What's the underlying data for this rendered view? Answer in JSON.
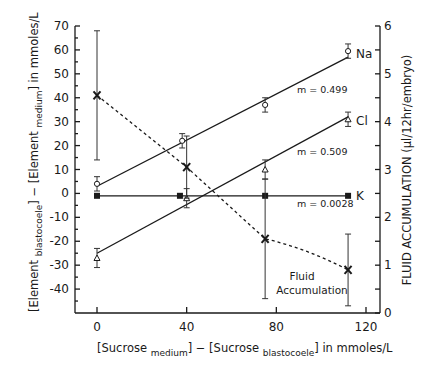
{
  "chart_data": {
    "type": "line",
    "title": "",
    "xlabel": "[Sucrose medium] − [Sucrose blastocoele] in mmoles/L",
    "xlabel_parts": {
      "bracket_open": "[",
      "a": "Sucrose",
      "a_sub": "medium",
      "minus": "] − [",
      "b": "Sucrose",
      "b_sub": "blastocoele",
      "unit": "] in mmoles/L"
    },
    "ylabel": "[Element blastocoele] − [Element medium] in mmoles/L",
    "ylabel_parts": {
      "a": "Element",
      "a_sub": "blastocoele",
      "minus": "] − [",
      "b": "Element",
      "b_sub": "medium",
      "unit": "] in mmoles/L"
    },
    "y2label": "FLUID ACCUMULATION (µl/12hr/embryo)",
    "xlim": [
      -10,
      122
    ],
    "ylim": [
      -50,
      70
    ],
    "y2lim": [
      0,
      6
    ],
    "x_ticks": [
      0,
      40,
      80,
      120
    ],
    "y_ticks": [
      70,
      60,
      50,
      40,
      30,
      20,
      10,
      0,
      -10,
      -20,
      -30,
      -40
    ],
    "y2_ticks": [
      6,
      5,
      4,
      3,
      2,
      1,
      0
    ],
    "grid": false,
    "series": [
      {
        "name": "Na",
        "marker": "open-circle",
        "line": "solid",
        "slope_label": "m = 0.499",
        "x": [
          0,
          38,
          75,
          112
        ],
        "values": [
          4,
          22,
          37,
          59.5
        ],
        "err": [
          3,
          3,
          3,
          3
        ],
        "fit": {
          "x0": 0,
          "y0": 3,
          "x1": 112,
          "y1": 57
        }
      },
      {
        "name": "Cl",
        "marker": "open-triangle",
        "line": "solid",
        "slope_label": "m = 0.509",
        "x": [
          0,
          40,
          75,
          112
        ],
        "values": [
          -27,
          -2,
          10,
          31
        ],
        "err": [
          4,
          4,
          4,
          3
        ],
        "fit": {
          "x0": 0,
          "y0": -25,
          "x1": 112,
          "y1": 32
        }
      },
      {
        "name": "K",
        "marker": "filled-square",
        "line": "solid",
        "slope_label": "m = 0.0028",
        "x": [
          0,
          37,
          75,
          112
        ],
        "values": [
          -1,
          -1,
          -1,
          -1
        ],
        "err": [
          0,
          0,
          0,
          0
        ],
        "fit": {
          "x0": 0,
          "y0": -1,
          "x1": 112,
          "y1": -1
        }
      },
      {
        "name": "Fluid Accumulation",
        "marker": "x",
        "line": "dashed",
        "axis": "right",
        "x": [
          0,
          40,
          75,
          112
        ],
        "values": [
          4.55,
          3.05,
          1.55,
          0.9
        ],
        "err": [
          1.35,
          0.65,
          1.25,
          0.75
        ]
      }
    ],
    "annotations": [
      "m = 0.499",
      "m = 0.509",
      "m = 0.0028",
      "Fluid",
      "Accumulation",
      "Na",
      "Cl",
      "K"
    ]
  },
  "labels": {
    "na": "Na",
    "cl": "Cl",
    "k": "K",
    "m_na": "m = 0.499",
    "m_cl": "m = 0.509",
    "m_k": "m = 0.0028",
    "fluid1": "Fluid",
    "fluid2": "Accumulation",
    "y2": "FLUID ACCUMULATION (µl/12hr/embryo)",
    "xl_a": "Sucrose",
    "xl_a_sub": "medium",
    "xl_b": "Sucrose",
    "xl_b_sub": "blastocoele",
    "xl_unit": "in mmoles/L",
    "yl_a": "Element",
    "yl_a_sub": "blastocoele",
    "yl_b": "Element",
    "yl_b_sub": "medium",
    "yl_unit": "in mmoles/L"
  }
}
